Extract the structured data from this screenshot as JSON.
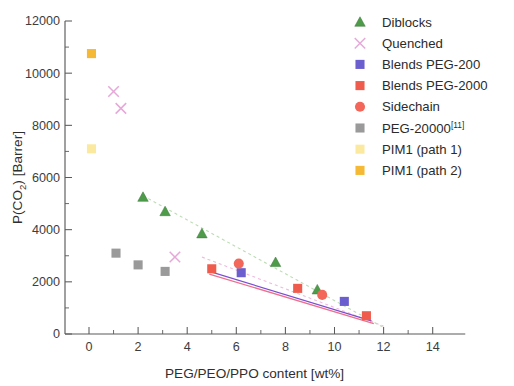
{
  "chart_data": {
    "type": "scatter",
    "title": "",
    "xlabel": "PEG/PEO/PPO content  [wt%]",
    "ylabel": "P(CO2) [Barrer]",
    "ylabel_parts": {
      "prefix": "P(CO",
      "sub": "2",
      "suffix": ") [Barrer]"
    },
    "xlim": [
      -1,
      15
    ],
    "ylim": [
      0,
      12000
    ],
    "xticks": [
      0,
      2,
      4,
      6,
      8,
      10,
      12,
      14
    ],
    "xticklabels": [
      "0",
      "2",
      "4",
      "6",
      "8",
      "10",
      "12",
      "14"
    ],
    "xminorticks": [
      1,
      3,
      5,
      7,
      9,
      11,
      13
    ],
    "yticks": [
      0,
      2000,
      4000,
      6000,
      8000,
      10000,
      12000
    ],
    "yticklabels": [
      "0",
      "2000",
      "4000",
      "6000",
      "8000",
      "10000",
      "12000"
    ],
    "yminorticks": [
      1000,
      3000,
      5000,
      7000,
      9000,
      11000
    ],
    "grid": false,
    "legend_position": "upper-right",
    "series": [
      {
        "name": "Diblocks",
        "marker": "triangle",
        "color": "#4e9b4a",
        "points": [
          {
            "x": 2.2,
            "y": 5250
          },
          {
            "x": 3.1,
            "y": 4700
          },
          {
            "x": 4.6,
            "y": 3850
          },
          {
            "x": 7.6,
            "y": 2750
          },
          {
            "x": 9.3,
            "y": 1700
          }
        ]
      },
      {
        "name": "Quenched",
        "marker": "cross",
        "color": "#e6a8d8",
        "points": [
          {
            "x": 1.0,
            "y": 9300
          },
          {
            "x": 1.3,
            "y": 8650
          },
          {
            "x": 3.5,
            "y": 2950
          }
        ]
      },
      {
        "name": "Blends PEG-200",
        "marker": "square",
        "color": "#6b5fd0",
        "points": [
          {
            "x": 6.2,
            "y": 2350
          },
          {
            "x": 10.4,
            "y": 1250
          }
        ]
      },
      {
        "name": "Blends PEG-2000",
        "marker": "square",
        "color": "#ef5b4c",
        "points": [
          {
            "x": 5.0,
            "y": 2500
          },
          {
            "x": 8.5,
            "y": 1750
          },
          {
            "x": 11.3,
            "y": 700
          }
        ]
      },
      {
        "name": "Sidechain",
        "marker": "circle",
        "color": "#f2675a",
        "points": [
          {
            "x": 6.1,
            "y": 2700
          },
          {
            "x": 9.5,
            "y": 1500
          }
        ]
      },
      {
        "name": "PEG-20000",
        "marker": "square",
        "color": "#9a9a9a",
        "reference": "[11]",
        "points": [
          {
            "x": 1.1,
            "y": 3100
          },
          {
            "x": 2.0,
            "y": 2650
          },
          {
            "x": 3.1,
            "y": 2400
          }
        ]
      },
      {
        "name": "PIM1 (path 1)",
        "marker": "square",
        "color": "#fbe9a0",
        "points": [
          {
            "x": 0.1,
            "y": 7100
          }
        ]
      },
      {
        "name": "PIM1 (path 2)",
        "marker": "square",
        "color": "#f5b935",
        "points": [
          {
            "x": 0.1,
            "y": 10750
          }
        ]
      }
    ],
    "trendlines": [
      {
        "name": "diblocks-trend",
        "color": "#bcdcb4",
        "dash": "3 3",
        "width": 1.1,
        "x1": 2.2,
        "y1": 5300,
        "x2": 12.0,
        "y2": 250
      },
      {
        "name": "quenched-trend",
        "color": "#f0b8dd",
        "dash": "3 3",
        "width": 1.1,
        "x1": 4.6,
        "y1": 2950,
        "x2": 12.0,
        "y2": 300
      },
      {
        "name": "blends-peg200-trend",
        "color": "#7a4fd0",
        "dash": "",
        "width": 1.3,
        "x1": 4.9,
        "y1": 2400,
        "x2": 11.5,
        "y2": 500
      },
      {
        "name": "blends-peg2000-trend",
        "color": "#ef6f8c",
        "dash": "",
        "width": 1.3,
        "x1": 4.9,
        "y1": 2300,
        "x2": 11.6,
        "y2": 400
      }
    ]
  },
  "legend": {
    "entries": [
      {
        "label": "Diblocks"
      },
      {
        "label": "Quenched"
      },
      {
        "label": "Blends PEG-200"
      },
      {
        "label": "Blends PEG-2000"
      },
      {
        "label": "Sidechain"
      },
      {
        "label": "PEG-20000",
        "sup": "[11]"
      },
      {
        "label": "PIM1 (path 1)"
      },
      {
        "label": "PIM1 (path 2)"
      }
    ]
  }
}
